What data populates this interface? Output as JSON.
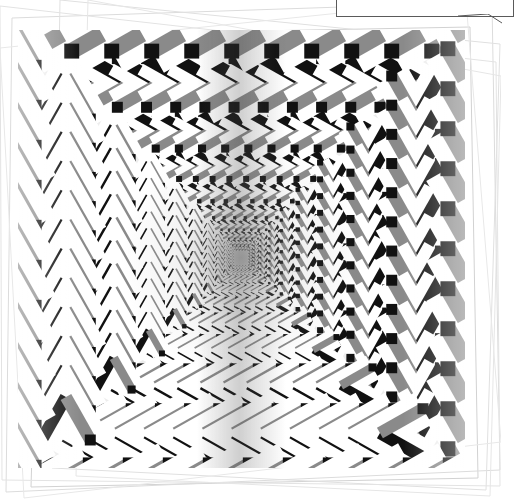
{
  "figure": {
    "panel": {
      "background_color": "#ededed",
      "width": 447,
      "height": 438,
      "left": 18,
      "top": 30
    }
  },
  "caption": {
    "text": "move less than the dark",
    "clipped": true
  },
  "colors": {
    "page_background": "#ffffff",
    "panel_background": "#ededed",
    "chevron_dark": "#111111",
    "chevron_mid": "#8a8a8a",
    "chevron_halo": "#ffffff",
    "frame_line": "#cfcfcf",
    "callout_border": "#5a5a5a",
    "caption_color": "#222222"
  },
  "chart_data": {
    "type": "scatter",
    "subtitle": "Radial array of two-tone chevrons with white halos on light gray field",
    "xlabel": "",
    "ylabel": "",
    "xlim": [
      0,
      447
    ],
    "ylim": [
      0,
      438
    ],
    "grid": false,
    "legend_position": "none",
    "center": {
      "x": 223,
      "y": 228
    },
    "quadrants": [
      {
        "name": "top",
        "direction": "right",
        "glyph": ">"
      },
      {
        "name": "left",
        "direction": "up",
        "glyph": "^"
      },
      {
        "name": "right",
        "direction": "down",
        "glyph": "v"
      },
      {
        "name": "bottom",
        "direction": "left",
        "glyph": "<"
      }
    ],
    "rings": 11,
    "elements_per_ring": 13,
    "size_growth_per_ring": 1.36,
    "min_element_px": 4,
    "max_element_px": 52,
    "stroke_ratio": 0.26,
    "halo_ratio": 0.52,
    "shading": {
      "center_radial_darkening": true,
      "vertical_center_seam": true,
      "edge_lightening": true
    }
  },
  "background_frames": {
    "count": 6,
    "stroke_color": "#cfcfcf",
    "note": "Faint overlapping rotated rectangle outlines, like stacked scanned pages."
  }
}
